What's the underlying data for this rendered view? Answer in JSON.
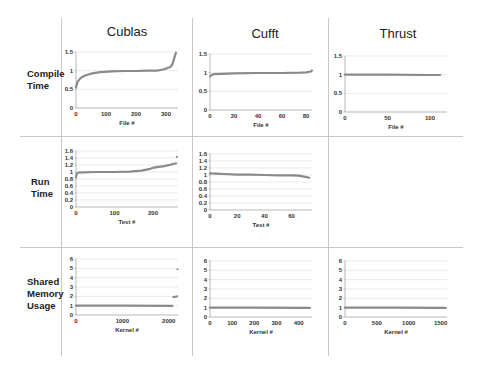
{
  "columns": [
    "Cublas",
    "Cufft",
    "Thrust"
  ],
  "rows": [
    {
      "label_lines": [
        "Compile",
        "Time"
      ]
    },
    {
      "label_lines": [
        "Run",
        "Time"
      ]
    },
    {
      "label_lines": [
        "Shared",
        "Memory",
        "Usage"
      ]
    }
  ],
  "series_color": "#8a8a8a",
  "chart_data": [
    {
      "type": "scatter",
      "row": "Compile Time",
      "column": "Cublas",
      "xlabel": "File #",
      "ylabel": "",
      "xlim": [
        0,
        340
      ],
      "ylim": [
        0,
        1.5
      ],
      "xticks": [
        0,
        100,
        200,
        300
      ],
      "yticks": [
        0,
        0.5,
        1,
        1.5
      ],
      "ytick_labels": [
        "0",
        "0.5",
        "1",
        "1.5"
      ],
      "grid": true,
      "x": [
        0,
        5,
        15,
        30,
        50,
        80,
        120,
        160,
        200,
        240,
        270,
        290,
        305,
        315,
        322,
        328,
        333
      ],
      "y": [
        0.55,
        0.7,
        0.8,
        0.87,
        0.92,
        0.96,
        0.98,
        0.99,
        0.99,
        1.0,
        1.0,
        1.03,
        1.07,
        1.1,
        1.18,
        1.35,
        1.48
      ]
    },
    {
      "type": "scatter",
      "row": "Compile Time",
      "column": "Cufft",
      "xlabel": "File #",
      "ylabel": "",
      "xlim": [
        0,
        85
      ],
      "ylim": [
        0,
        1.5
      ],
      "xticks": [
        0,
        20,
        40,
        60,
        80
      ],
      "yticks": [
        0,
        0.5,
        1,
        1.5
      ],
      "ytick_labels": [
        "0",
        "0.5",
        "1",
        "1.5"
      ],
      "grid": true,
      "x": [
        0,
        1,
        3,
        10,
        20,
        40,
        60,
        75,
        80,
        84,
        85
      ],
      "y": [
        0.9,
        0.93,
        0.96,
        0.97,
        0.98,
        0.99,
        0.99,
        1.0,
        1.01,
        1.03,
        1.06
      ]
    },
    {
      "type": "scatter",
      "row": "Compile Time",
      "column": "Thrust",
      "xlabel": "File #",
      "ylabel": "",
      "xlim": [
        0,
        120
      ],
      "ylim": [
        0,
        1.5
      ],
      "xticks": [
        0,
        50,
        100
      ],
      "yticks": [
        0,
        0.5,
        1,
        1.5
      ],
      "ytick_labels": [
        "0",
        "0.5",
        "1",
        "1.5"
      ],
      "grid": true,
      "x": [
        0,
        50,
        100,
        112
      ],
      "y": [
        1.0,
        1.0,
        0.99,
        0.99
      ]
    },
    {
      "type": "scatter",
      "row": "Run Time",
      "column": "Cublas",
      "xlabel": "Test #",
      "ylabel": "",
      "xlim": [
        0,
        265
      ],
      "ylim": [
        0,
        1.6
      ],
      "xticks": [
        0,
        100,
        200
      ],
      "yticks": [
        0,
        0.2,
        0.4,
        0.6,
        0.8,
        1,
        1.2,
        1.4,
        1.6
      ],
      "ytick_labels": [
        "0",
        "0.2",
        "0.4",
        "0.6",
        "0.8",
        "1",
        "1.2",
        "1.4",
        "1.6"
      ],
      "grid": true,
      "x": [
        0,
        2,
        5,
        20,
        50,
        100,
        140,
        170,
        190,
        200,
        210,
        230,
        250,
        260
      ],
      "y": [
        0.85,
        0.95,
        0.98,
        0.99,
        1.0,
        1.0,
        1.01,
        1.04,
        1.08,
        1.12,
        1.14,
        1.17,
        1.22,
        1.25
      ],
      "outliers": [
        {
          "x": 262,
          "y": 1.43
        }
      ]
    },
    {
      "type": "scatter",
      "row": "Run Time",
      "column": "Cufft",
      "xlabel": "Test #",
      "ylabel": "",
      "xlim": [
        0,
        75
      ],
      "ylim": [
        0,
        1.6
      ],
      "xticks": [
        0,
        20,
        40,
        60
      ],
      "yticks": [
        0,
        0.2,
        0.4,
        0.6,
        0.8,
        1,
        1.2,
        1.4,
        1.6
      ],
      "ytick_labels": [
        "0",
        "0.2",
        "0.4",
        "0.6",
        "0.8",
        "1",
        "1.2",
        "1.4",
        "1.6"
      ],
      "grid": true,
      "x": [
        0,
        5,
        10,
        20,
        30,
        40,
        50,
        60,
        65,
        70,
        73
      ],
      "y": [
        1.05,
        1.04,
        1.03,
        1.01,
        1.01,
        1.0,
        0.99,
        0.99,
        0.98,
        0.95,
        0.92
      ]
    },
    {
      "type": "scatter",
      "row": "Shared Memory Usage",
      "column": "Cublas",
      "xlabel": "Kernel #",
      "ylabel": "",
      "xlim": [
        0,
        2200
      ],
      "ylim": [
        0,
        6
      ],
      "xticks": [
        0,
        1000,
        2000
      ],
      "yticks": [
        0,
        1,
        2,
        3,
        4,
        5,
        6
      ],
      "ytick_labels": [
        "0",
        "1",
        "2",
        "3",
        "4",
        "5",
        "6"
      ],
      "grid": true,
      "x": [
        0,
        1000,
        2080
      ],
      "y": [
        1.0,
        1.0,
        0.97
      ],
      "extra_segments": [
        {
          "x": [
            2080,
            2200
          ],
          "y": [
            1.9,
            2.0
          ]
        }
      ],
      "outliers": [
        {
          "x": 2190,
          "y": 4.9
        }
      ]
    },
    {
      "type": "scatter",
      "row": "Shared Memory Usage",
      "column": "Cufft",
      "xlabel": "Kernel #",
      "ylabel": "",
      "xlim": [
        0,
        460
      ],
      "ylim": [
        0,
        6
      ],
      "xticks": [
        0,
        100,
        200,
        300,
        400
      ],
      "yticks": [
        0,
        1,
        2,
        3,
        4,
        5,
        6
      ],
      "ytick_labels": [
        "0",
        "1",
        "2",
        "3",
        "4",
        "5",
        "6"
      ],
      "grid": true,
      "x": [
        0,
        200,
        450
      ],
      "y": [
        1.0,
        1.0,
        0.97
      ]
    },
    {
      "type": "scatter",
      "row": "Shared Memory Usage",
      "column": "Thrust",
      "xlabel": "Kernel #",
      "ylabel": "",
      "xlim": [
        0,
        1600
      ],
      "ylim": [
        0,
        6
      ],
      "xticks": [
        0,
        500,
        1000,
        1500
      ],
      "yticks": [
        0,
        1,
        2,
        3,
        4,
        5,
        6
      ],
      "ytick_labels": [
        "0",
        "1",
        "2",
        "3",
        "4",
        "5",
        "6"
      ],
      "grid": true,
      "x": [
        0,
        800,
        1580
      ],
      "y": [
        1.0,
        1.0,
        0.97
      ]
    }
  ]
}
